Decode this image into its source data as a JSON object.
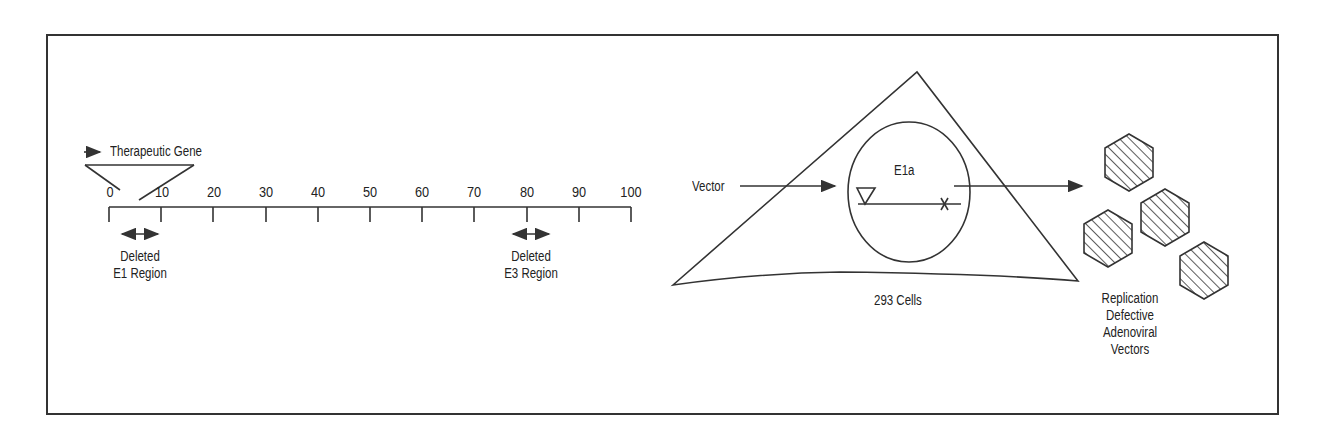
{
  "figure": {
    "left_panel": {
      "gene_label": "Therapeutic Gene",
      "scale_ticks": [
        "0",
        "10",
        "20",
        "30",
        "40",
        "50",
        "60",
        "70",
        "80",
        "90",
        "100"
      ],
      "deleted_e1": {
        "line1": "Deleted",
        "line2": "E1 Region"
      },
      "deleted_e3": {
        "line1": "Deleted",
        "line2": "E3 Region"
      }
    },
    "right_panel": {
      "vector_label": "Vector",
      "nucleus_label": "E1a",
      "cell_label": "293 Cells",
      "product_label": {
        "line1": "Replication",
        "line2": "Defective",
        "line3": "Adenoviral",
        "line4": "Vectors"
      }
    },
    "colors": {
      "line": "#333333",
      "text": "#222222",
      "background": "#ffffff"
    }
  }
}
